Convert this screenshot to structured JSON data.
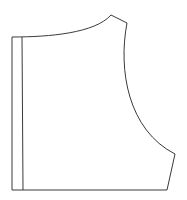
{
  "diagram": {
    "type": "sewing-pattern-piece",
    "stroke_color": "#3a3a3a",
    "background": "#ffffff",
    "points": {
      "top_left": [
        12,
        37
      ],
      "placket_top": [
        22,
        37
      ],
      "neck_end_shoulder": [
        111,
        15
      ],
      "shoulder_end": [
        127,
        23
      ],
      "armhole_end": [
        175,
        154
      ],
      "side_bottom": [
        167,
        190
      ],
      "bottom_left": [
        12,
        190
      ],
      "placket_bottom": [
        23,
        190
      ]
    }
  }
}
